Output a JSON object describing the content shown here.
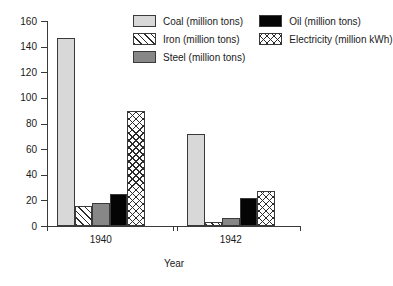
{
  "chart_data": {
    "type": "bar",
    "title": "",
    "subtitle": "",
    "xlabel": "Year",
    "ylabel": "",
    "categories": [
      "1940",
      "1942"
    ],
    "series": [
      {
        "name": "Coal (million tons)",
        "key": "coal",
        "pattern": "solid-light-gray",
        "color": "#d8d8d8",
        "values": [
          147,
          72
        ]
      },
      {
        "name": "Iron (million tons)",
        "key": "iron",
        "pattern": "diagonal-hatch",
        "color": "#ffffff",
        "values": [
          15.5,
          3
        ]
      },
      {
        "name": "Steel (million tons)",
        "key": "steel",
        "pattern": "solid-mid-gray",
        "color": "#878787",
        "values": [
          18,
          6
        ]
      },
      {
        "name": "Oil (million tons)",
        "key": "oil",
        "pattern": "solid-black",
        "color": "#050505",
        "values": [
          25,
          21.5
        ]
      },
      {
        "name": "Electricity (million kWh)",
        "key": "electricity",
        "pattern": "cross-hatch",
        "color": "#ffffff",
        "values": [
          90,
          27.5
        ]
      }
    ],
    "ylim": [
      0,
      160
    ],
    "ytick_values": [
      160,
      140,
      120,
      100,
      80,
      60,
      40,
      20,
      0
    ],
    "ytick_labels": [
      "160",
      "140",
      "120",
      "100",
      "80",
      "60",
      "40",
      "20",
      "0"
    ],
    "grid": false,
    "legend_position": "top-center",
    "legend_order": [
      "Coal (million tons)",
      "Oil (million tons)",
      "Iron (million tons)",
      "Electricity (million kWh)",
      "Steel (million tons)"
    ]
  },
  "axis": {
    "x_title": "Year",
    "group_labels": [
      "1940",
      "1942"
    ]
  },
  "legend": {
    "items": [
      {
        "label": "Coal (million tons)",
        "key": "coal"
      },
      {
        "label": "Oil (million tons)",
        "key": "oil"
      },
      {
        "label": "Iron (million tons)",
        "key": "iron"
      },
      {
        "label": "Electricity (million kWh)",
        "key": "electricity"
      },
      {
        "label": "Steel (million tons)",
        "key": "steel"
      }
    ]
  },
  "colors": {
    "coal": "#d8d8d8",
    "iron": "#ffffff",
    "steel": "#878787",
    "oil": "#050505",
    "electricity": "#ffffff",
    "axis": "#3a3a3a",
    "text": "#1a1a1a",
    "background": "#ffffff"
  }
}
